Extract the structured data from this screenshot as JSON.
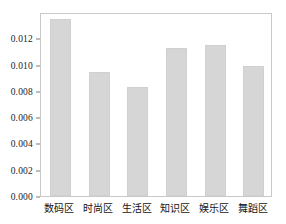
{
  "chart_data": {
    "type": "bar",
    "title": "",
    "subtitle": "",
    "xlabel": "",
    "ylabel": "",
    "categories": [
      "数码区",
      "时尚区",
      "生活区",
      "知识区",
      "娱乐区",
      "舞蹈区"
    ],
    "values": [
      0.0135,
      0.0094,
      0.0083,
      0.0113,
      0.0115,
      0.0099
    ],
    "series": [
      {
        "name": "",
        "values": [
          0.0135,
          0.0094,
          0.0083,
          0.0113,
          0.0115,
          0.0099
        ]
      }
    ],
    "ylim": [
      0.0,
      0.014
    ],
    "ytick_values": [
      0.0,
      0.002,
      0.004,
      0.006,
      0.008,
      0.01,
      0.012
    ],
    "ytick_labels": [
      "0.000",
      "0.002",
      "0.004",
      "0.006",
      "0.008",
      "0.010",
      "0.012"
    ],
    "grid": false,
    "legend": false,
    "legend_position": "none",
    "bar_color": "#d6d6d6",
    "bar_edge_color": "#d0d0d0",
    "axis_color": "#c9c9c9",
    "text_color": "#1c1c1c"
  }
}
